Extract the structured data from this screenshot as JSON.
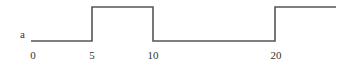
{
  "diagram": {
    "signal_label": "a",
    "line_color": "#555555",
    "text_color": "#333333",
    "tick_labels": [
      {
        "text": "0",
        "x": 33
      },
      {
        "text": "5",
        "x": 92
      },
      {
        "text": "10",
        "x": 153
      },
      {
        "text": "20",
        "x": 276
      }
    ],
    "waveform": {
      "type": "step",
      "levels": {
        "low_y": 41,
        "high_y": 7
      },
      "points": [
        [
          31,
          41
        ],
        [
          92,
          41
        ],
        [
          92,
          7
        ],
        [
          153,
          7
        ],
        [
          153,
          41
        ],
        [
          275,
          41
        ],
        [
          275,
          7
        ],
        [
          336,
          7
        ]
      ]
    }
  }
}
